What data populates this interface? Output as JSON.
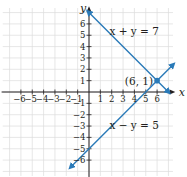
{
  "chart_data": {
    "type": "line",
    "title": "",
    "xlabel": "x",
    "ylabel": "y",
    "xlim": [
      -7,
      7
    ],
    "ylim": [
      -7,
      7
    ],
    "grid": true,
    "x_ticks": [
      -6,
      -5,
      -4,
      -3,
      -2,
      -1,
      1,
      2,
      3,
      4,
      5,
      6
    ],
    "y_ticks": [
      -6,
      -5,
      -4,
      -3,
      -2,
      -1,
      1,
      2,
      3,
      4,
      5,
      6
    ],
    "x_tick_labels": [
      "−6",
      "−5",
      "−4",
      "−3",
      "−2",
      "−1",
      "1",
      "2",
      "3",
      "4",
      "5",
      "6"
    ],
    "y_tick_labels": [
      "−6",
      "−5",
      "−4",
      "−3",
      "−2",
      "−1",
      "1",
      "2",
      "3",
      "4",
      "5",
      "6"
    ],
    "series": [
      {
        "name": "x + y = 7",
        "label": "x + y = 7",
        "slope": -1,
        "intercept": 7,
        "x": [
          0,
          7
        ],
        "y": [
          7,
          0
        ]
      },
      {
        "name": "x − y = 5",
        "label": "x − y = 5",
        "slope": 1,
        "intercept": -5,
        "x": [
          -1,
          7.5
        ],
        "y": [
          -6,
          2.5
        ]
      }
    ],
    "annotations": [
      {
        "text": "(6, 1)",
        "x": 6,
        "y": 1,
        "type": "intersection-point"
      }
    ],
    "colors": {
      "line": "#2a7ab8",
      "grid": "#dcdcdc",
      "axis": "#231f20",
      "point": "#2a7ab8"
    }
  }
}
